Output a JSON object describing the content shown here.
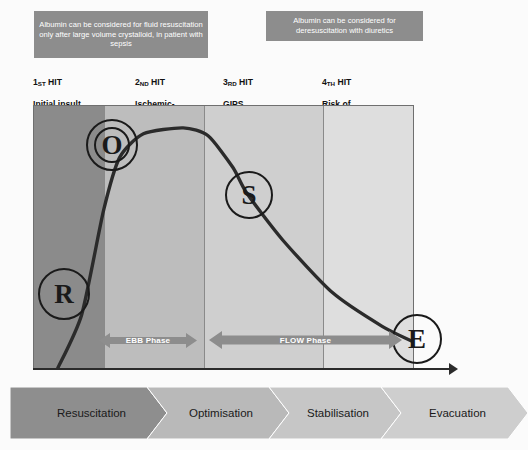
{
  "callouts": [
    {
      "id": "albumin-resuscitation",
      "text": "Albumin can be considered for fluid resuscitation only after large volume crystalloid, in patient with sepsis",
      "bg": "#8d8d8d",
      "color": "#ffffff"
    },
    {
      "id": "albumin-deresuscitation",
      "text": "Albumin can be considered for deresuscitation with diuretics",
      "bg": "#8d8d8d",
      "color": "#ffffff"
    }
  ],
  "hits": [
    {
      "number": "1",
      "ordinal": "ST",
      "title": "HIT",
      "desc": "Initial insult"
    },
    {
      "number": "2",
      "ordinal": "ND",
      "title": "HIT",
      "desc": "Ischemic-\nReperfusion"
    },
    {
      "number": "3",
      "ordinal": "RD",
      "title": "HIT",
      "desc": "GIPS"
    },
    {
      "number": "4",
      "ordinal": "TH",
      "title": "HIT",
      "desc": "Risk of\nhypoperfusion"
    }
  ],
  "chart_data": {
    "type": "line",
    "xlabel": "",
    "ylabel": "",
    "grid": false,
    "legend": "none",
    "xlim": [
      0,
      381
    ],
    "ylim": [
      0,
      264
    ],
    "series": [
      {
        "name": "Fluid status / volume curve",
        "points": [
          {
            "x": 24,
            "y": 264
          },
          {
            "x": 48,
            "y": 210
          },
          {
            "x": 70,
            "y": 105
          },
          {
            "x": 86,
            "y": 52
          },
          {
            "x": 110,
            "y": 28
          },
          {
            "x": 150,
            "y": 22
          },
          {
            "x": 175,
            "y": 30
          },
          {
            "x": 200,
            "y": 62
          },
          {
            "x": 214,
            "y": 88
          },
          {
            "x": 250,
            "y": 135
          },
          {
            "x": 300,
            "y": 188
          },
          {
            "x": 350,
            "y": 222
          },
          {
            "x": 382,
            "y": 238
          }
        ],
        "color": "#2b2b2b",
        "width": 3.4
      }
    ],
    "bands": [
      {
        "label": "Resuscitation",
        "x0": 0,
        "x1": 70,
        "color": "#8b8b8b"
      },
      {
        "label": "Optimisation",
        "x0": 70,
        "x1": 170,
        "color": "#bdbdbd"
      },
      {
        "label": "Stabilisation",
        "x0": 170,
        "x1": 289,
        "color": "#cfcfcf"
      },
      {
        "label": "Evacuation",
        "x0": 289,
        "x1": 381,
        "color": "#dedede"
      }
    ],
    "markers": [
      {
        "letter": "R",
        "name": "Resuscitation",
        "x": 29,
        "y": 187
      },
      {
        "letter": "O",
        "name": "Optimisation",
        "x": 77,
        "y": 38
      },
      {
        "letter": "S",
        "name": "Stabilisation",
        "x": 214,
        "y": 88
      },
      {
        "letter": "E",
        "name": "Evacuation",
        "x": 382,
        "y": 232
      }
    ],
    "annotations": [
      {
        "label": "EBB Phase",
        "type": "double-arrow",
        "x0": 66,
        "x1": 164,
        "y": 231
      },
      {
        "label": "FLOW Phase",
        "type": "double-arrow",
        "x0": 176,
        "x1": 369,
        "y": 229
      }
    ]
  },
  "phases": {
    "ebb": "EBB Phase",
    "flow": "FLOW Phase"
  },
  "stages": [
    {
      "label": "Resuscitation",
      "color": "#8e8e8e"
    },
    {
      "label": "Optimisation",
      "color": "#b9b9b9"
    },
    {
      "label": "Stabilisation",
      "color": "#c6c6c6"
    },
    {
      "label": "Evacuation",
      "color": "#cecece"
    }
  ],
  "colors": {
    "frame": "#6f6f6f",
    "curve": "#2b2b2b",
    "arrow": "#8d8d8d",
    "axis": "#2b2b2b"
  }
}
